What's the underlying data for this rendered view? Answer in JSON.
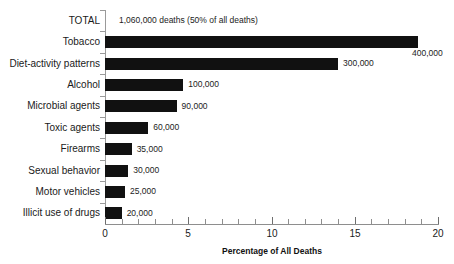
{
  "chart_data": {
    "type": "bar",
    "orientation": "horizontal",
    "title": "",
    "xlabel": "Percentage of All Deaths",
    "ylabel": "",
    "xlim": [
      0,
      20
    ],
    "xticks": [
      0,
      5,
      10,
      15,
      20
    ],
    "xtick_labels": [
      "0",
      "5",
      "10",
      "15",
      "20"
    ],
    "xminor_tick_step": 1,
    "grid": false,
    "legend": null,
    "bar_color": "#111111",
    "categories": [
      "TOTAL",
      "Tobacco",
      "Diet-activity patterns",
      "Alcohol",
      "Microbial agents",
      "Toxic agents",
      "Firearms",
      "Sexual behavior",
      "Motor vehicles",
      "Illicit use of drugs"
    ],
    "values": [
      null,
      18.8,
      14.0,
      4.7,
      4.3,
      2.6,
      1.6,
      1.4,
      1.2,
      1.0
    ],
    "data_labels": [
      "1,060,000 deaths (50% of all deaths)",
      "400,000",
      "300,000",
      "100,000",
      "90,000",
      "60,000",
      "35,000",
      "30,000",
      "25,000",
      "20,000"
    ],
    "points": [
      {
        "category": "TOTAL",
        "percent": null,
        "deaths_label": "1,060,000 deaths (50% of all deaths)",
        "is_total_row": true
      },
      {
        "category": "Tobacco",
        "percent": 18.8,
        "deaths_label": "400,000",
        "is_total_row": false
      },
      {
        "category": "Diet-activity patterns",
        "percent": 14.0,
        "deaths_label": "300,000",
        "is_total_row": false
      },
      {
        "category": "Alcohol",
        "percent": 4.7,
        "deaths_label": "100,000",
        "is_total_row": false
      },
      {
        "category": "Microbial agents",
        "percent": 4.3,
        "deaths_label": "90,000",
        "is_total_row": false
      },
      {
        "category": "Toxic agents",
        "percent": 2.6,
        "deaths_label": "60,000",
        "is_total_row": false
      },
      {
        "category": "Firearms",
        "percent": 1.6,
        "deaths_label": "35,000",
        "is_total_row": false
      },
      {
        "category": "Sexual behavior",
        "percent": 1.4,
        "deaths_label": "30,000",
        "is_total_row": false
      },
      {
        "category": "Motor vehicles",
        "percent": 1.2,
        "deaths_label": "25,000",
        "is_total_row": false
      },
      {
        "category": "Illicit use of drugs",
        "percent": 1.0,
        "deaths_label": "20,000",
        "is_total_row": false
      }
    ]
  }
}
